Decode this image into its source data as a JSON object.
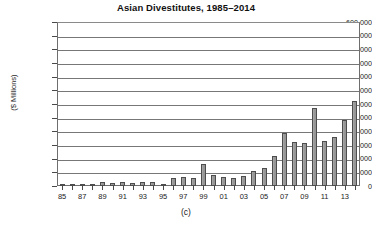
{
  "chart_data": {
    "type": "bar",
    "title": "Asian Divestitutes, 1985–2014",
    "caption": "(c)",
    "xlabel": "",
    "ylabel": "($ Millions)",
    "ylim": [
      0,
      600000
    ],
    "ytick_step": 50000,
    "grid": true,
    "legend": "none",
    "ytick_labels": [
      "600,000",
      "550,000",
      "500,000",
      "450,000",
      "400,000",
      "350,000",
      "300,000",
      "250,000",
      "200,000",
      "150,000",
      "100,000",
      "50,000",
      "0"
    ],
    "ytick_values": [
      600000,
      550000,
      500000,
      450000,
      400000,
      350000,
      300000,
      250000,
      200000,
      150000,
      100000,
      50000,
      0
    ],
    "categories": [
      "85",
      "86",
      "87",
      "88",
      "89",
      "90",
      "91",
      "92",
      "93",
      "94",
      "95",
      "96",
      "97",
      "98",
      "99",
      "00",
      "01",
      "02",
      "03",
      "04",
      "05",
      "06",
      "07",
      "08",
      "09",
      "10",
      "11",
      "12",
      "13",
      "14"
    ],
    "xtick_labels_shown": [
      "85",
      "87",
      "89",
      "91",
      "93",
      "95",
      "97",
      "99",
      "01",
      "03",
      "05",
      "07",
      "09",
      "11",
      "13"
    ],
    "values": [
      2000,
      3000,
      6000,
      9000,
      14000,
      12000,
      13000,
      11000,
      16000,
      13000,
      9000,
      28000,
      34000,
      29000,
      79000,
      40000,
      32000,
      30000,
      35000,
      56000,
      66000,
      110000,
      195000,
      160000,
      158000,
      285000,
      165000,
      180000,
      240000,
      310000
    ],
    "value_unit": "$ Millions",
    "bar_color": "#9a9a9a",
    "bar_edge_color": "#4d4d4d",
    "axis_color": "#6e6e6e",
    "grid_color": "#777777"
  }
}
